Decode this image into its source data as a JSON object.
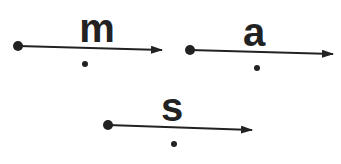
{
  "diagram": {
    "colors": {
      "ink": "#222222",
      "background": "#ffffff"
    },
    "vectors": [
      {
        "label": "m",
        "start": [
          18,
          46
        ],
        "end": [
          162,
          50
        ],
        "label_pos": [
          97,
          42
        ],
        "dot": [
          85,
          64
        ]
      },
      {
        "label": "a",
        "start": [
          190,
          50
        ],
        "end": [
          333,
          54
        ],
        "label_pos": [
          256,
          46
        ],
        "dot": [
          257,
          68
        ]
      },
      {
        "label": "s",
        "start": [
          108,
          125
        ],
        "end": [
          252,
          130
        ],
        "label_pos": [
          172,
          122
        ],
        "dot": [
          174,
          144
        ]
      }
    ]
  }
}
